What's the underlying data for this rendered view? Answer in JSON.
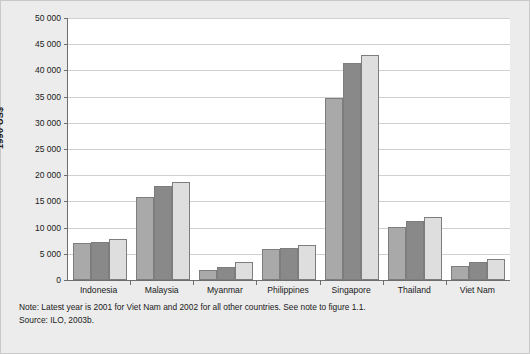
{
  "chart_data": {
    "type": "bar",
    "title": "",
    "xlabel": "",
    "ylabel": "1990 US$",
    "ylim": [
      0,
      50000
    ],
    "grid": true,
    "legend": "none",
    "categories": [
      "Indonesia",
      "Malaysia",
      "Myanmar",
      "Philippines",
      "Singapore",
      "Thailand",
      "Viet Nam"
    ],
    "ytick_labels": [
      "0",
      "5 000",
      "10 000",
      "15 000",
      "20 000",
      "25 000",
      "30 000",
      "35 000",
      "40 000",
      "45 000",
      "50 000"
    ],
    "ytick_values": [
      0,
      5000,
      10000,
      15000,
      20000,
      25000,
      30000,
      35000,
      40000,
      45000,
      50000
    ],
    "series": [
      {
        "name": "series-1",
        "color": "#a9a9a9",
        "values": [
          7000,
          15800,
          2000,
          5900,
          34700,
          10100,
          2600
        ]
      },
      {
        "name": "series-2",
        "color": "#898989",
        "values": [
          7300,
          17900,
          2500,
          6200,
          41500,
          11200,
          3500
        ]
      },
      {
        "name": "series-3",
        "color": "#dedede",
        "values": [
          7900,
          18800,
          3400,
          6700,
          43000,
          12000,
          4000
        ]
      }
    ]
  },
  "notes": {
    "note_line": "Note: Latest year is 2001 for Viet Nam and 2002 for all other countries. See note to figure 1.1.",
    "source_line": "Source: ILO, 2003b."
  },
  "colors": {
    "background": "#ececec",
    "plot_background": "#ffffff",
    "axis": "#6e6e6e",
    "gridline": "#d0d0d0",
    "text": "#1a1a1a"
  }
}
